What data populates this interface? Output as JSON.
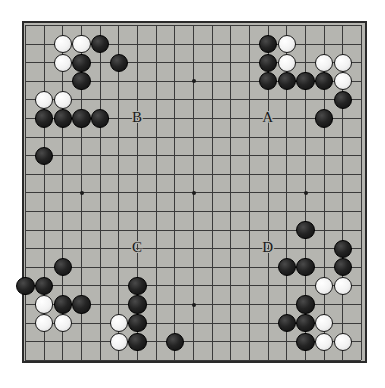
{
  "diagram": {
    "board_size": 19,
    "colors": {
      "board_bg": "#b5b5b0",
      "grid_line": "#3a3a3a",
      "border": "#2a2a2a",
      "black_stone": "#141414",
      "white_stone": "#f5f5f5",
      "page_bg": "#ffffff"
    },
    "geometry": {
      "board_left": 22,
      "board_top": 21,
      "board_width": 345,
      "board_height": 342,
      "origin_x": 25,
      "origin_y": 25,
      "spacing_x": 18.67,
      "spacing_y": 18.6,
      "stone_diameter": 18.2
    },
    "star_points": [
      {
        "col": 4,
        "row": 4
      },
      {
        "col": 10,
        "row": 4
      },
      {
        "col": 16,
        "row": 4
      },
      {
        "col": 4,
        "row": 10
      },
      {
        "col": 10,
        "row": 10
      },
      {
        "col": 16,
        "row": 10
      },
      {
        "col": 4,
        "row": 16
      },
      {
        "col": 10,
        "row": 16
      },
      {
        "col": 16,
        "row": 16
      }
    ],
    "stones": [
      {
        "color": "white",
        "col": 3,
        "row": 2
      },
      {
        "color": "white",
        "col": 4,
        "row": 2
      },
      {
        "color": "black",
        "col": 5,
        "row": 2
      },
      {
        "color": "black",
        "col": 14,
        "row": 2
      },
      {
        "color": "white",
        "col": 15,
        "row": 2
      },
      {
        "color": "white",
        "col": 3,
        "row": 3
      },
      {
        "color": "black",
        "col": 4,
        "row": 3
      },
      {
        "color": "black",
        "col": 6,
        "row": 3
      },
      {
        "color": "black",
        "col": 14,
        "row": 3
      },
      {
        "color": "white",
        "col": 15,
        "row": 3
      },
      {
        "color": "white",
        "col": 17,
        "row": 3
      },
      {
        "color": "white",
        "col": 18,
        "row": 3
      },
      {
        "color": "black",
        "col": 4,
        "row": 4
      },
      {
        "color": "black",
        "col": 14,
        "row": 4
      },
      {
        "color": "black",
        "col": 15,
        "row": 4
      },
      {
        "color": "black",
        "col": 16,
        "row": 4
      },
      {
        "color": "black",
        "col": 17,
        "row": 4
      },
      {
        "color": "white",
        "col": 18,
        "row": 4
      },
      {
        "color": "white",
        "col": 2,
        "row": 5
      },
      {
        "color": "white",
        "col": 3,
        "row": 5
      },
      {
        "color": "black",
        "col": 18,
        "row": 5
      },
      {
        "color": "black",
        "col": 2,
        "row": 6
      },
      {
        "color": "black",
        "col": 3,
        "row": 6
      },
      {
        "color": "black",
        "col": 4,
        "row": 6
      },
      {
        "color": "black",
        "col": 5,
        "row": 6
      },
      {
        "color": "black",
        "col": 17,
        "row": 6
      },
      {
        "color": "black",
        "col": 2,
        "row": 8
      },
      {
        "color": "black",
        "col": 16,
        "row": 12
      },
      {
        "color": "black",
        "col": 18,
        "row": 13
      },
      {
        "color": "black",
        "col": 15,
        "row": 14
      },
      {
        "color": "black",
        "col": 16,
        "row": 14
      },
      {
        "color": "black",
        "col": 18,
        "row": 14
      },
      {
        "color": "black",
        "col": 3,
        "row": 14
      },
      {
        "color": "black",
        "col": 1,
        "row": 15
      },
      {
        "color": "black",
        "col": 2,
        "row": 15
      },
      {
        "color": "black",
        "col": 7,
        "row": 15
      },
      {
        "color": "white",
        "col": 17,
        "row": 15
      },
      {
        "color": "white",
        "col": 18,
        "row": 15
      },
      {
        "color": "white",
        "col": 2,
        "row": 16
      },
      {
        "color": "black",
        "col": 3,
        "row": 16
      },
      {
        "color": "black",
        "col": 4,
        "row": 16
      },
      {
        "color": "black",
        "col": 7,
        "row": 16
      },
      {
        "color": "black",
        "col": 16,
        "row": 16
      },
      {
        "color": "white",
        "col": 2,
        "row": 17
      },
      {
        "color": "white",
        "col": 3,
        "row": 17
      },
      {
        "color": "white",
        "col": 6,
        "row": 17
      },
      {
        "color": "black",
        "col": 7,
        "row": 17
      },
      {
        "color": "black",
        "col": 15,
        "row": 17
      },
      {
        "color": "black",
        "col": 16,
        "row": 17
      },
      {
        "color": "white",
        "col": 17,
        "row": 17
      },
      {
        "color": "white",
        "col": 6,
        "row": 18
      },
      {
        "color": "black",
        "col": 7,
        "row": 18
      },
      {
        "color": "black",
        "col": 9,
        "row": 18
      },
      {
        "color": "black",
        "col": 16,
        "row": 18
      },
      {
        "color": "white",
        "col": 17,
        "row": 18
      },
      {
        "color": "white",
        "col": 18,
        "row": 18
      }
    ],
    "markers": [
      {
        "label": "B",
        "col": 7,
        "row": 6
      },
      {
        "label": "A",
        "col": 14,
        "row": 6
      },
      {
        "label": "C",
        "col": 7,
        "row": 13
      },
      {
        "label": "D",
        "col": 14,
        "row": 13
      }
    ]
  }
}
